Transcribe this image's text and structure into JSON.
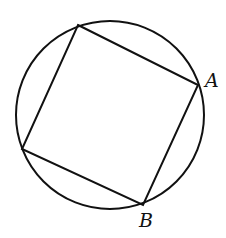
{
  "diagram": {
    "stroke_color": "#111111",
    "background": "#ffffff",
    "circle": {
      "cx": 110,
      "cy": 115,
      "r": 94
    },
    "square_vertices": [
      {
        "x": 78,
        "y": 25
      },
      {
        "x": 198,
        "y": 85
      },
      {
        "x": 143,
        "y": 205
      },
      {
        "x": 22,
        "y": 149
      }
    ],
    "labels": {
      "A": {
        "text": "A",
        "x": 205,
        "y": 87
      },
      "B": {
        "text": "B",
        "x": 139,
        "y": 227
      }
    }
  }
}
